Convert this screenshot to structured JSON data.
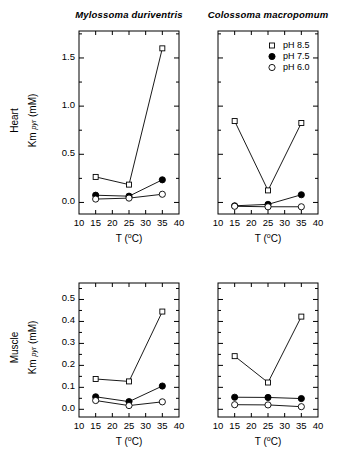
{
  "figure": {
    "width": 344,
    "height": 456,
    "background": "#ffffff",
    "foreground": "#000000"
  },
  "columns": [
    {
      "id": "mylossoma",
      "title": "Mylossoma duriventris"
    },
    {
      "id": "colossoma",
      "title": "Colossoma macropomum"
    }
  ],
  "rows": [
    {
      "id": "heart",
      "label": "Heart"
    },
    {
      "id": "muscle",
      "label": "Muscle"
    }
  ],
  "axes": {
    "xlabel_main": "T",
    "xlabel_units": "(°C)",
    "xlabel": "T (°C)",
    "ylabel_main": "Km",
    "ylabel_sub": "pyr",
    "ylabel_units": "(mM)",
    "ylabel": "Km pyr (mM)",
    "xticks": [
      10,
      15,
      20,
      25,
      30,
      35,
      40
    ],
    "xticklabels": [
      "10",
      "15",
      "20",
      "25",
      "30",
      "35",
      "40"
    ],
    "xlim": [
      10,
      40
    ],
    "heart_yticks": [
      0.0,
      0.5,
      1.0,
      1.5
    ],
    "heart_yticklabels": [
      "0.0",
      "0.5",
      "1.0",
      "1.5"
    ],
    "heart_minor_yticks": [
      0.25,
      0.75,
      1.25,
      1.75
    ],
    "heart_ylim": [
      -0.12,
      1.78
    ],
    "muscle_yticks": [
      0.0,
      0.1,
      0.2,
      0.3,
      0.4,
      0.5
    ],
    "muscle_yticklabels": [
      "0.0",
      "0.1",
      "0.2",
      "0.3",
      "0.4",
      "0.5"
    ],
    "muscle_minor_yticks": [
      0.05,
      0.15,
      0.25,
      0.35,
      0.45,
      0.55
    ],
    "muscle_ylim": [
      -0.035,
      0.575
    ],
    "grid": false
  },
  "legend": {
    "position": "top-right of Colossoma heart panel",
    "entries": [
      {
        "marker": "open-square",
        "label": "pH 8.5"
      },
      {
        "marker": "filled-circle",
        "label": "pH 7.5"
      },
      {
        "marker": "open-circle",
        "label": "pH 6.0"
      }
    ]
  },
  "chart_data": [
    {
      "id": "heart-mylossoma",
      "type": "line",
      "title": "Mylossoma duriventris",
      "row": "Heart",
      "xlabel": "T (°C)",
      "ylabel": "Km pyr (mM)",
      "x": [
        15,
        25,
        35
      ],
      "xlim": [
        10,
        40
      ],
      "ylim": [
        -0.12,
        1.78
      ],
      "grid": false,
      "series": [
        {
          "name": "pH 8.5",
          "marker": "open-square",
          "values": [
            0.265,
            0.185,
            1.6
          ]
        },
        {
          "name": "pH 7.5",
          "marker": "filled-circle",
          "values": [
            0.075,
            0.065,
            0.235
          ]
        },
        {
          "name": "pH 6.0",
          "marker": "open-circle",
          "values": [
            0.035,
            0.045,
            0.085
          ]
        }
      ]
    },
    {
      "id": "heart-colossoma",
      "type": "line",
      "title": "Colossoma macropomum",
      "row": "Heart",
      "xlabel": "T (°C)",
      "ylabel": "Km pyr (mM)",
      "x": [
        15,
        25,
        35
      ],
      "xlim": [
        10,
        40
      ],
      "ylim": [
        -0.12,
        1.78
      ],
      "grid": false,
      "series": [
        {
          "name": "pH 8.5",
          "marker": "open-square",
          "values": [
            0.845,
            0.125,
            0.825
          ]
        },
        {
          "name": "pH 7.5",
          "marker": "filled-circle",
          "values": [
            -0.035,
            -0.02,
            0.08
          ]
        },
        {
          "name": "pH 6.0",
          "marker": "open-circle",
          "values": [
            -0.04,
            -0.045,
            -0.045
          ]
        }
      ]
    },
    {
      "id": "muscle-mylossoma",
      "type": "line",
      "title": "Mylossoma duriventris",
      "row": "Muscle",
      "xlabel": "T (°C)",
      "ylabel": "Km pyr (mM)",
      "x": [
        15,
        25,
        35
      ],
      "xlim": [
        10,
        40
      ],
      "ylim": [
        -0.035,
        0.575
      ],
      "grid": false,
      "series": [
        {
          "name": "pH 8.5",
          "marker": "open-square",
          "values": [
            0.138,
            0.127,
            0.445
          ]
        },
        {
          "name": "pH 7.5",
          "marker": "filled-circle",
          "values": [
            0.057,
            0.035,
            0.106
          ]
        },
        {
          "name": "pH 6.0",
          "marker": "open-circle",
          "values": [
            0.04,
            0.017,
            0.034
          ]
        }
      ]
    },
    {
      "id": "muscle-colossoma",
      "type": "line",
      "title": "Colossoma macropomum",
      "row": "Muscle",
      "xlabel": "T (°C)",
      "ylabel": "Km pyr (mM)",
      "x": [
        15,
        25,
        35
      ],
      "xlim": [
        10,
        40
      ],
      "ylim": [
        -0.035,
        0.575
      ],
      "grid": false,
      "series": [
        {
          "name": "pH 8.5",
          "marker": "open-square",
          "values": [
            0.242,
            0.122,
            0.422
          ]
        },
        {
          "name": "pH 7.5",
          "marker": "filled-circle",
          "values": [
            0.055,
            0.054,
            0.049
          ]
        },
        {
          "name": "pH 6.0",
          "marker": "open-circle",
          "values": [
            0.021,
            0.02,
            0.012
          ]
        }
      ]
    }
  ]
}
